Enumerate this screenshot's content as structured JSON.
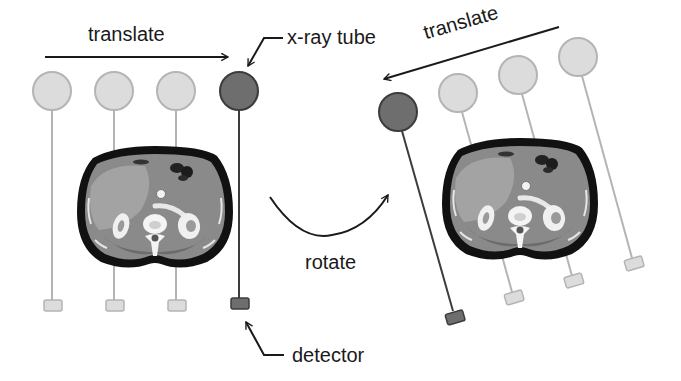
{
  "diagram": {
    "labels": {
      "translate_left": "translate",
      "translate_right": "translate",
      "xray_tube": "x-ray tube",
      "detector": "detector",
      "rotate": "rotate"
    },
    "colors": {
      "background": "#ffffff",
      "active_fill": "#6e6e6e",
      "active_stroke": "#3c3c3c",
      "ghost_fill": "#dcdcdc",
      "ghost_stroke": "#b4b4b4",
      "arrow": "#1a1a1a",
      "body_outline": "#111111",
      "tissue": "#8c8c8c"
    },
    "left_panel": {
      "description": "Tube-detector pair translated horizontally across patient",
      "positions": [
        {
          "tube": [
            52,
            91
          ],
          "detector": [
            53,
            306
          ],
          "state": "ghost"
        },
        {
          "tube": [
            114,
            91
          ],
          "detector": [
            115,
            306
          ],
          "state": "ghost"
        },
        {
          "tube": [
            176,
            91
          ],
          "detector": [
            177,
            306
          ],
          "state": "ghost"
        },
        {
          "tube": [
            239,
            91
          ],
          "detector": [
            240,
            303
          ],
          "state": "active"
        }
      ]
    },
    "right_panel": {
      "description": "Same pair after rotation, translated along rotated axis",
      "rotation_deg": -16,
      "positions": [
        {
          "tube": [
            398,
            112
          ],
          "detector": [
            455,
            317
          ],
          "state": "active"
        },
        {
          "tube": [
            458,
            93
          ],
          "detector": [
            514,
            298
          ],
          "state": "ghost"
        },
        {
          "tube": [
            518,
            75
          ],
          "detector": [
            574,
            281
          ],
          "state": "ghost"
        },
        {
          "tube": [
            578,
            57
          ],
          "detector": [
            634,
            263
          ],
          "state": "ghost"
        }
      ]
    }
  }
}
